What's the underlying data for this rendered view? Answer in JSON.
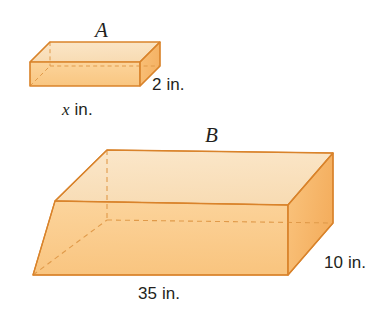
{
  "figure": {
    "title": "",
    "type": "geometry-diagram",
    "background_color": "#ffffff",
    "colors": {
      "top_face": "#fae2c0",
      "front_face": "#fbce8f",
      "side_face": "#f9c179",
      "edge_stroke": "#d9832b",
      "hidden_edge_stroke": "#e09a4a",
      "label_text": "#231f20"
    },
    "shapes": [
      {
        "name": "prism-A",
        "letter_label": "A",
        "dimension_labels": [
          {
            "name": "width-label",
            "text": "x in.",
            "value": "x",
            "unit": "in.",
            "italic_part": "x"
          },
          {
            "name": "height-label",
            "text": "2 in.",
            "value": "2",
            "unit": "in."
          }
        ]
      },
      {
        "name": "prism-B",
        "letter_label": "B",
        "dimension_labels": [
          {
            "name": "width-label",
            "text": "35 in.",
            "value": "35",
            "unit": "in."
          },
          {
            "name": "height-label",
            "text": "10 in.",
            "value": "10",
            "unit": "in."
          }
        ]
      }
    ],
    "labels": {
      "a": "A",
      "b": "B",
      "x_in": "x in.",
      "x_var": "x",
      "x_unit": " in.",
      "two_in": "2 in.",
      "thirtyfive_in": "35 in.",
      "ten_in": "10 in."
    }
  }
}
